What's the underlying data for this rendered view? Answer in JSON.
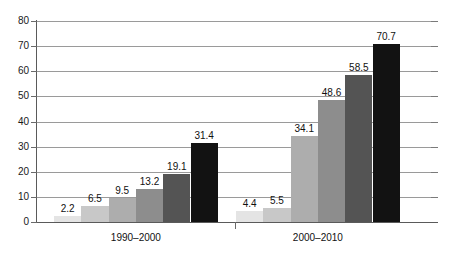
{
  "chart_data": {
    "type": "bar",
    "title": "",
    "subtitle": "",
    "xlabel": "",
    "ylabel": "",
    "ylim": [
      0,
      80
    ],
    "ytick_step": 10,
    "yticks": [
      0,
      10,
      20,
      30,
      40,
      50,
      60,
      70,
      80
    ],
    "ytick_labels": [
      "0",
      "10",
      "20",
      "30",
      "40",
      "50",
      "60",
      "70",
      "80"
    ],
    "grid": true,
    "grid_axis": "y",
    "legend": false,
    "legend_position": "none",
    "categories": [
      "1990–2000",
      "2000–2010"
    ],
    "series": [
      {
        "name": "series-1",
        "color": "#e4e4e4",
        "values": [
          2.2,
          4.4
        ]
      },
      {
        "name": "series-2",
        "color": "#c8c8c8",
        "values": [
          6.5,
          5.5
        ]
      },
      {
        "name": "series-3",
        "color": "#adadad",
        "values": [
          9.5,
          34.1
        ]
      },
      {
        "name": "series-4",
        "color": "#8d8d8d",
        "values": [
          13.2,
          48.6
        ]
      },
      {
        "name": "series-5",
        "color": "#545454",
        "values": [
          19.1,
          58.5
        ]
      },
      {
        "name": "series-6",
        "color": "#121212",
        "values": [
          31.4,
          70.7
        ]
      }
    ],
    "data_labels": {
      "1990–2000": [
        "2.2",
        "6.5",
        "9.5",
        "13.2",
        "19.1",
        "31.4"
      ],
      "2000–2010": [
        "4.4",
        "5.5",
        "34.1",
        "48.6",
        "58.5",
        "70.7"
      ]
    },
    "axis_color": "#5a5a5a",
    "gridline_color": "#9a9a9a",
    "background": "#ffffff"
  }
}
